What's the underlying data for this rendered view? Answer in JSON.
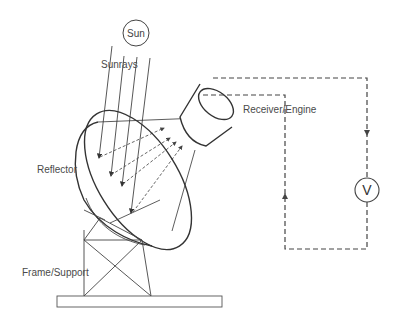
{
  "diagram": {
    "labels": {
      "sun": "Sun",
      "sunrays": "Sunrays",
      "receiver": "Receiver/Engine",
      "reflector": "Reflector",
      "frame": "Frame/Support",
      "voltmeter": "V"
    },
    "colors": {
      "stroke": "#333333",
      "light_stroke": "#555555",
      "text": "#4a4a4a",
      "background": "#ffffff"
    }
  }
}
